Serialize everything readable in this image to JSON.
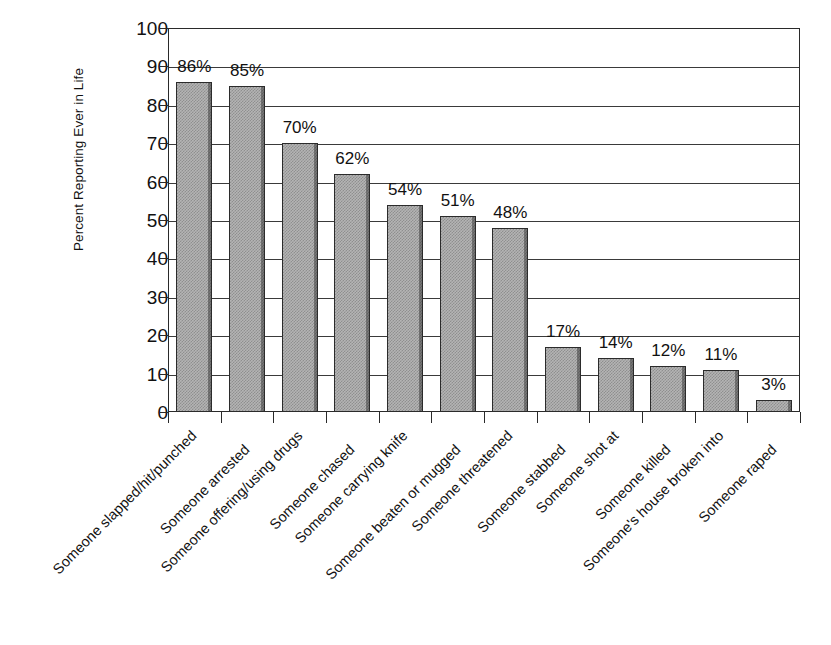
{
  "chart_data": {
    "type": "bar",
    "title": "",
    "subtitle": "",
    "xlabel": "",
    "ylabel": "Percent Reporting Ever in Life",
    "ylim": [
      0,
      100
    ],
    "y_ticks": [
      0,
      10,
      20,
      30,
      40,
      50,
      60,
      70,
      80,
      90,
      100
    ],
    "grid": true,
    "legend": null,
    "orientation": "vertical",
    "bar_fill_color": "#b4b4b4",
    "bar_border_color": "#2b2b2b",
    "categories": [
      "Someone slapped/hit/punched",
      "Someone arrested",
      "Someone offering/using drugs",
      "Someone chased",
      "Someone carrying knife",
      "Someone beaten or mugged",
      "Someone threatened",
      "Someone stabbed",
      "Someone shot at",
      "Someone killed",
      "Someone's house broken into",
      "Someone raped"
    ],
    "values": [
      86,
      85,
      70,
      62,
      54,
      51,
      48,
      17,
      14,
      12,
      11,
      3
    ],
    "data_labels": [
      "86%",
      "85%",
      "70%",
      "62%",
      "54%",
      "51%",
      "48%",
      "17%",
      "14%",
      "12%",
      "11%",
      "3%"
    ]
  }
}
